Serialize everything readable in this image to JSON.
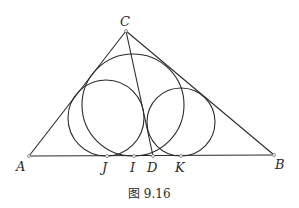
{
  "figure": {
    "caption": "图 9.16",
    "points": {
      "A": {
        "label": "A",
        "x": 29,
        "y": 156
      },
      "B": {
        "label": "B",
        "x": 274,
        "y": 155
      },
      "C": {
        "label": "C",
        "x": 126,
        "y": 31
      },
      "J": {
        "label": "J",
        "x": 107,
        "y": 156
      },
      "I": {
        "label": "I",
        "x": 134,
        "y": 156
      },
      "D": {
        "label": "D",
        "x": 153,
        "y": 156
      },
      "K": {
        "label": "K",
        "x": 181,
        "y": 156
      }
    },
    "segments": [
      {
        "from": "A",
        "to": "B"
      },
      {
        "from": "A",
        "to": "C"
      },
      {
        "from": "B",
        "to": "C"
      },
      {
        "from": "C",
        "to": "D"
      }
    ],
    "circles": [
      {
        "name": "incircle",
        "cx": 133,
        "cy": 105,
        "r": 51,
        "tangent_point": "I"
      },
      {
        "name": "left-circle",
        "cx": 106,
        "cy": 118,
        "r": 38,
        "tangent_point": "J"
      },
      {
        "name": "right-circle",
        "cx": 181,
        "cy": 122,
        "r": 34,
        "tangent_point": "K"
      }
    ]
  }
}
